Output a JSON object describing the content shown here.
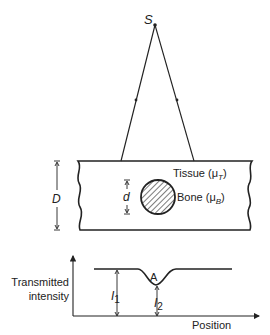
{
  "source": {
    "label": "S"
  },
  "tissue": {
    "label": "Tissue (μ",
    "sub": "T",
    "close": ")"
  },
  "bone": {
    "label": "Bone (μ",
    "sub": "B",
    "close": ")"
  },
  "dimensions": {
    "slab_thickness": "D",
    "bone_diameter": "d"
  },
  "graph": {
    "ylabel_line1": "Transmitted",
    "ylabel_line2": "intensity",
    "xlabel": "Position",
    "point_label": "A",
    "i1_main": "I",
    "i1_sub": "1",
    "i2_main": "I",
    "i2_sub": "2"
  },
  "colors": {
    "line": "#222222",
    "background": "#ffffff"
  }
}
